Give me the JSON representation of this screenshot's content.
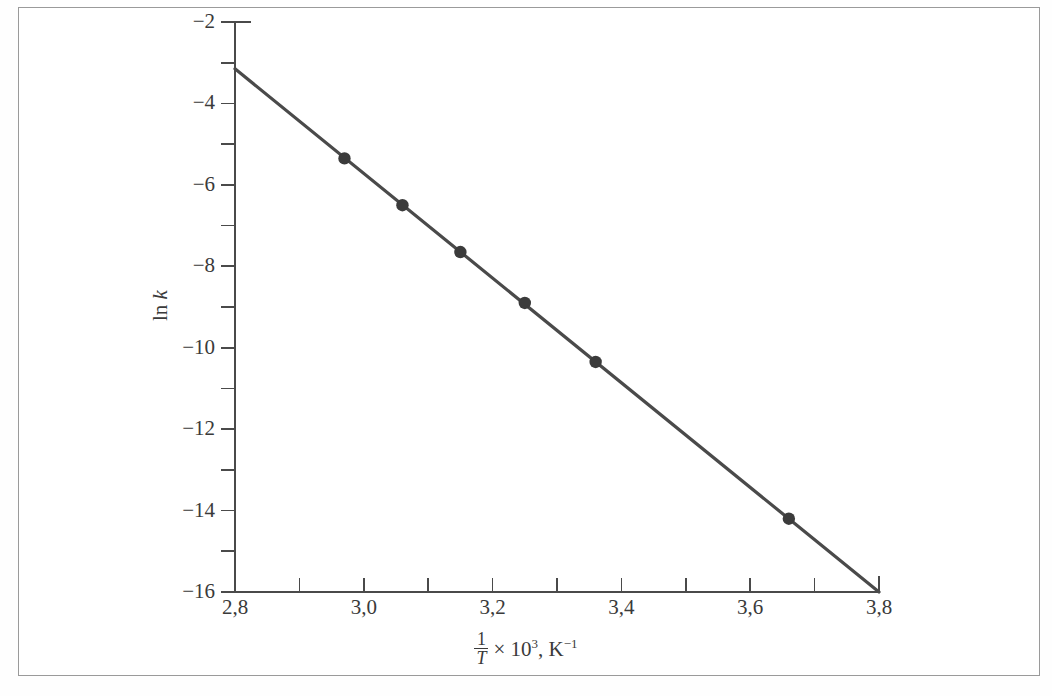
{
  "figure": {
    "background_color": "#ffffff",
    "frame_color": "#9a9a9a",
    "axis_color": "#4a4a4a",
    "line_color": "#4a4a4a",
    "marker_color": "#3b3b3b"
  },
  "axes": {
    "y_title_prefix": "ln ",
    "y_title_symbol": "k",
    "x_title_numerator": "1",
    "x_title_denominator": "T",
    "x_title_multiplier": " × 10",
    "x_title_multiplier_exp": "3",
    "x_title_units_sep": ", K",
    "x_title_units_exp": "−1"
  },
  "chart_data": {
    "type": "scatter",
    "title": "",
    "xlabel": "1/T × 10^3, K^-1",
    "ylabel": "ln k",
    "xlim": [
      2.8,
      3.8
    ],
    "ylim": [
      -16,
      -2
    ],
    "grid": false,
    "legend": null,
    "x_major_step": 0.2,
    "x_minor_step": 0.1,
    "y_major_step": 2,
    "y_minor_step": 1,
    "x_tick_labels": [
      "2,8",
      "3,0",
      "3,2",
      "3,4",
      "3,6",
      "3,8"
    ],
    "x_tick_values": [
      2.8,
      3.0,
      3.2,
      3.4,
      3.6,
      3.8
    ],
    "x_minor_tick_values": [
      2.9,
      3.1,
      3.3,
      3.5,
      3.7
    ],
    "y_tick_labels": [
      "−2",
      "−4",
      "−6",
      "−8",
      "−10",
      "−12",
      "−14",
      "−16"
    ],
    "y_tick_values": [
      -2,
      -4,
      -6,
      -8,
      -10,
      -12,
      -14,
      -16
    ],
    "y_minor_tick_values": [
      -3,
      -5,
      -7,
      -9,
      -11,
      -13,
      -15
    ],
    "series": [
      {
        "name": "ln k vs 1/T",
        "marker": "filled-circle",
        "x": [
          2.97,
          3.06,
          3.15,
          3.25,
          3.36,
          3.66
        ],
        "y": [
          -5.35,
          -6.5,
          -7.65,
          -8.9,
          -10.35,
          -14.2
        ]
      }
    ],
    "fit_line": {
      "name": "least-squares line",
      "x": [
        2.8,
        3.8
      ],
      "y": [
        -3.15,
        -16.0
      ],
      "slope": -12.85,
      "intercept": 32.83
    }
  }
}
